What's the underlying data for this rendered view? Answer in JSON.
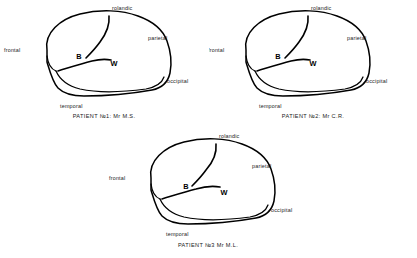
{
  "figure": {
    "type": "anatomical-diagram",
    "background_color": "#ffffff",
    "ink_color": "#000000",
    "lesion_fill_color": "#b3b3b3"
  },
  "lobe_labels": {
    "frontal": "frontal",
    "rolandic": "rolandic",
    "parietal": "parietal",
    "occipital": "occipital",
    "temporal": "temporal"
  },
  "site_markers": {
    "broca": "B",
    "wernicke": "W"
  },
  "panels": [
    {
      "id": "panel-1",
      "caption": "PATIENT №1: Mr M.S.",
      "patient_number": "1",
      "patient_name": "Mr M.S.",
      "lesion_shape": "irregular-blob",
      "labels": {
        "frontal": "frontal",
        "rolandic": "rolandic",
        "parietal": "parietal",
        "occipital": "occipital",
        "temporal": "temporal"
      },
      "markers": {
        "broca": "B",
        "wernicke": "W"
      }
    },
    {
      "id": "panel-2",
      "caption": "PATIENT №2: Mr C.R.",
      "patient_number": "2",
      "patient_name": "Mr C.R.",
      "lesion_shape": "irregular-blob",
      "labels": {
        "frontal": "frontal",
        "rolandic": "rolandic",
        "parietal": "parietal",
        "occipital": "occipital",
        "temporal": "temporal"
      },
      "markers": {
        "broca": "B",
        "wernicke": "W"
      }
    },
    {
      "id": "panel-3",
      "caption": "PATIENT №3  Mr M.L.",
      "patient_number": "3",
      "patient_name": "Mr M.L.",
      "lesion_shape": "rectangular-patch",
      "labels": {
        "frontal": "frontal",
        "rolandic": "rolandic",
        "parietal": "parietal",
        "occipital": "occipital",
        "temporal": "temporal"
      },
      "markers": {
        "broca": "B",
        "wernicke": "W"
      }
    }
  ]
}
